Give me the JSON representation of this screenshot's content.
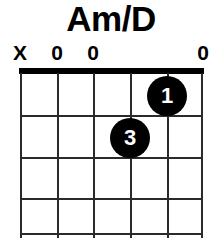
{
  "chord": {
    "name": "Am/D",
    "instrument": "guitar",
    "string_count": 6,
    "fret_count": 4,
    "base_fret": 1,
    "nut_shown": true,
    "string_markers": [
      {
        "string": 1,
        "symbol": "X",
        "meaning": "muted",
        "x": 20
      },
      {
        "string": 2,
        "symbol": "0",
        "meaning": "open",
        "x": 57
      },
      {
        "string": 3,
        "symbol": "0",
        "meaning": "open",
        "x": 93
      },
      {
        "string": 4,
        "symbol": "",
        "meaning": "fretted",
        "x": 130
      },
      {
        "string": 5,
        "symbol": "",
        "meaning": "fretted",
        "x": 167
      },
      {
        "string": 6,
        "symbol": "0",
        "meaning": "open",
        "x": 203
      }
    ],
    "finger_dots": [
      {
        "label": "1",
        "string": 5,
        "fret": 1,
        "cx": 147,
        "cy": 28
      },
      {
        "label": "3",
        "string": 4,
        "fret": 2,
        "cx": 110,
        "cy": 70
      }
    ],
    "string_x": [
      0,
      37,
      73,
      110,
      147,
      183
    ],
    "fret_y": [
      5,
      47,
      89,
      130,
      165
    ],
    "colors": {
      "ink": "#000000",
      "grid": "#2a2a2a",
      "background": "#ffffff",
      "dot_fill": "#000000",
      "dot_text": "#ffffff"
    }
  }
}
